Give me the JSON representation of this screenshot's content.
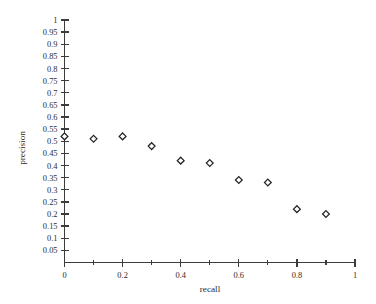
{
  "chart_data": {
    "type": "scatter",
    "title": "",
    "xlabel": "recall",
    "ylabel": "precision",
    "xlim": [
      0,
      1
    ],
    "ylim": [
      0,
      1
    ],
    "grid": false,
    "legend": null,
    "marker": "open-diamond",
    "marker_color": "#232323",
    "background_color": "#ffffff",
    "axis_color": "#3c3c3c",
    "x": [
      0,
      0.1,
      0.2,
      0.3,
      0.4,
      0.5,
      0.6,
      0.7,
      0.8,
      0.9
    ],
    "values": [
      0.52,
      0.51,
      0.52,
      0.48,
      0.42,
      0.41,
      0.34,
      0.33,
      0.22,
      0.2
    ],
    "points": [
      {
        "x": 0,
        "y": 0.52
      },
      {
        "x": 0.1,
        "y": 0.51
      },
      {
        "x": 0.2,
        "y": 0.52
      },
      {
        "x": 0.3,
        "y": 0.48
      },
      {
        "x": 0.4,
        "y": 0.42
      },
      {
        "x": 0.5,
        "y": 0.41
      },
      {
        "x": 0.6,
        "y": 0.34
      },
      {
        "x": 0.7,
        "y": 0.33
      },
      {
        "x": 0.8,
        "y": 0.22
      },
      {
        "x": 0.9,
        "y": 0.2
      }
    ],
    "xticks": [
      0,
      0.2,
      0.4,
      0.6,
      0.8,
      1
    ],
    "xtick_labels": [
      "0",
      "0.2",
      "0.4",
      "0.6",
      "0.8",
      "1"
    ],
    "xticks_minor": [
      0.1,
      0.3,
      0.5,
      0.7,
      0.9
    ],
    "yticks": [
      0.05,
      0.1,
      0.15,
      0.2,
      0.25,
      0.3,
      0.35,
      0.4,
      0.45,
      0.5,
      0.55,
      0.6,
      0.65,
      0.7,
      0.75,
      0.8,
      0.85,
      0.9,
      0.95,
      1
    ],
    "ytick_labels": [
      "0.05",
      "0.1",
      "0.15",
      "0.2",
      "0.25",
      "0.3",
      "0.35",
      "0.4",
      "0.45",
      "0.5",
      "0.55",
      "0.6",
      "0.65",
      "0.7",
      "0.75",
      "0.8",
      "0.85",
      "0.9",
      "0.95",
      "1"
    ]
  }
}
